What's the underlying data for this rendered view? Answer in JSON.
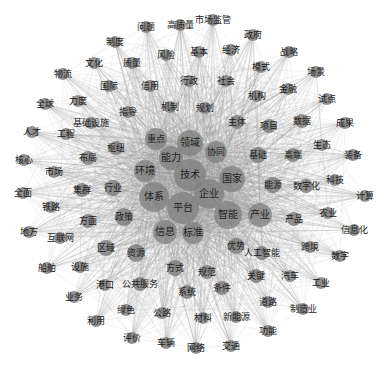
{
  "figure": {
    "type": "co-occurrence network",
    "width": 387,
    "height": 369,
    "colors": {
      "background": "#ffffff",
      "edge": "#9a9a9a",
      "node": "#7f7f7f",
      "label": "#222222"
    }
  },
  "nodes": [
    {
      "id": "问题",
      "x": 146,
      "y": 27,
      "r": 6,
      "fs": 9
    },
    {
      "id": "高质量",
      "x": 180,
      "y": 25,
      "r": 6,
      "fs": 9
    },
    {
      "id": "市场监管",
      "x": 213,
      "y": 20,
      "r": 6,
      "fs": 9
    },
    {
      "id": "政府",
      "x": 253,
      "y": 35,
      "r": 6,
      "fs": 9
    },
    {
      "id": "制度",
      "x": 115,
      "y": 42,
      "r": 6,
      "fs": 9
    },
    {
      "id": "风险",
      "x": 166,
      "y": 55,
      "r": 6,
      "fs": 9
    },
    {
      "id": "基本",
      "x": 199,
      "y": 52,
      "r": 6,
      "fs": 9
    },
    {
      "id": "经济",
      "x": 231,
      "y": 50,
      "r": 6,
      "fs": 9
    },
    {
      "id": "战略",
      "x": 289,
      "y": 52,
      "r": 6,
      "fs": 9
    },
    {
      "id": "文化",
      "x": 94,
      "y": 63,
      "r": 6,
      "fs": 9
    },
    {
      "id": "质量",
      "x": 132,
      "y": 63,
      "r": 6,
      "fs": 9
    },
    {
      "id": "模式",
      "x": 261,
      "y": 67,
      "r": 6,
      "fs": 9
    },
    {
      "id": "场景",
      "x": 316,
      "y": 72,
      "r": 6,
      "fs": 9
    },
    {
      "id": "物流",
      "x": 63,
      "y": 74,
      "r": 6,
      "fs": 9
    },
    {
      "id": "国际",
      "x": 109,
      "y": 86,
      "r": 6,
      "fs": 9
    },
    {
      "id": "信用",
      "x": 150,
      "y": 86,
      "r": 6,
      "fs": 9
    },
    {
      "id": "行政",
      "x": 189,
      "y": 81,
      "r": 6,
      "fs": 9
    },
    {
      "id": "社会",
      "x": 226,
      "y": 81,
      "r": 6,
      "fs": 9
    },
    {
      "id": "金融",
      "x": 288,
      "y": 89,
      "r": 6,
      "fs": 9
    },
    {
      "id": "全球",
      "x": 45,
      "y": 104,
      "r": 6,
      "fs": 9
    },
    {
      "id": "力度",
      "x": 78,
      "y": 101,
      "r": 6,
      "fs": 9
    },
    {
      "id": "机构",
      "x": 257,
      "y": 96,
      "r": 6,
      "fs": 9
    },
    {
      "id": "试点",
      "x": 327,
      "y": 99,
      "r": 6,
      "fs": 9
    },
    {
      "id": "指导",
      "x": 128,
      "y": 112,
      "r": 6,
      "fs": 9
    },
    {
      "id": "机制",
      "x": 170,
      "y": 107,
      "r": 6,
      "fs": 9
    },
    {
      "id": "规划",
      "x": 205,
      "y": 108,
      "r": 6,
      "fs": 9
    },
    {
      "id": "基础设施",
      "x": 91,
      "y": 123,
      "r": 6,
      "fs": 9
    },
    {
      "id": "主体",
      "x": 237,
      "y": 122,
      "r": 7,
      "fs": 9
    },
    {
      "id": "项目",
      "x": 269,
      "y": 126,
      "r": 7,
      "fs": 9
    },
    {
      "id": "数据",
      "x": 302,
      "y": 121,
      "r": 7,
      "fs": 9
    },
    {
      "id": "成果",
      "x": 345,
      "y": 123,
      "r": 6,
      "fs": 9
    },
    {
      "id": "人才",
      "x": 32,
      "y": 132,
      "r": 6,
      "fs": 9
    },
    {
      "id": "工程",
      "x": 66,
      "y": 134,
      "r": 6,
      "fs": 9
    },
    {
      "id": "重点",
      "x": 156,
      "y": 139,
      "r": 11,
      "fs": 9
    },
    {
      "id": "领域",
      "x": 190,
      "y": 143,
      "r": 13,
      "fs": 10
    },
    {
      "id": "枢纽",
      "x": 116,
      "y": 148,
      "r": 7,
      "fs": 9
    },
    {
      "id": "生态",
      "x": 322,
      "y": 145,
      "r": 6,
      "fs": 9
    },
    {
      "id": "核心",
      "x": 24,
      "y": 160,
      "r": 6,
      "fs": 9
    },
    {
      "id": "布局",
      "x": 88,
      "y": 158,
      "r": 7,
      "fs": 9
    },
    {
      "id": "能力",
      "x": 171,
      "y": 158,
      "r": 12,
      "fs": 10
    },
    {
      "id": "协同",
      "x": 216,
      "y": 152,
      "r": 11,
      "fs": 9
    },
    {
      "id": "基础",
      "x": 258,
      "y": 155,
      "r": 8,
      "fs": 9
    },
    {
      "id": "高端",
      "x": 293,
      "y": 155,
      "r": 7,
      "fs": 9
    },
    {
      "id": "装备",
      "x": 353,
      "y": 155,
      "r": 6,
      "fs": 9
    },
    {
      "id": "市场",
      "x": 54,
      "y": 172,
      "r": 6,
      "fs": 9
    },
    {
      "id": "环境",
      "x": 145,
      "y": 171,
      "r": 11,
      "fs": 10
    },
    {
      "id": "技术",
      "x": 190,
      "y": 175,
      "r": 16,
      "fs": 10
    },
    {
      "id": "国家",
      "x": 232,
      "y": 179,
      "r": 13,
      "fs": 10
    },
    {
      "id": "能源",
      "x": 273,
      "y": 185,
      "r": 8,
      "fs": 9
    },
    {
      "id": "数字化",
      "x": 306,
      "y": 186,
      "r": 7,
      "fs": 9
    },
    {
      "id": "科技",
      "x": 335,
      "y": 180,
      "r": 6,
      "fs": 9
    },
    {
      "id": "全面",
      "x": 23,
      "y": 193,
      "r": 6,
      "fs": 9
    },
    {
      "id": "集群",
      "x": 82,
      "y": 190,
      "r": 7,
      "fs": 9
    },
    {
      "id": "行业",
      "x": 113,
      "y": 188,
      "r": 8,
      "fs": 9
    },
    {
      "id": "体系",
      "x": 154,
      "y": 197,
      "r": 15,
      "fs": 10
    },
    {
      "id": "企业",
      "x": 209,
      "y": 194,
      "r": 15,
      "fs": 10
    },
    {
      "id": "计算",
      "x": 365,
      "y": 196,
      "r": 6,
      "fs": 9
    },
    {
      "id": "铁路",
      "x": 51,
      "y": 207,
      "r": 6,
      "fs": 9
    },
    {
      "id": "平台",
      "x": 183,
      "y": 208,
      "r": 16,
      "fs": 10
    },
    {
      "id": "智能",
      "x": 228,
      "y": 215,
      "r": 14,
      "fs": 10
    },
    {
      "id": "产业",
      "x": 260,
      "y": 215,
      "r": 12,
      "fs": 10
    },
    {
      "id": "产品",
      "x": 294,
      "y": 219,
      "r": 7,
      "fs": 9
    },
    {
      "id": "农业",
      "x": 328,
      "y": 213,
      "r": 6,
      "fs": 9
    },
    {
      "id": "方面",
      "x": 88,
      "y": 221,
      "r": 7,
      "fs": 9
    },
    {
      "id": "政策",
      "x": 124,
      "y": 217,
      "r": 9,
      "fs": 9
    },
    {
      "id": "信息化",
      "x": 354,
      "y": 230,
      "r": 6,
      "fs": 9
    },
    {
      "id": "地方",
      "x": 29,
      "y": 232,
      "r": 6,
      "fs": 9
    },
    {
      "id": "信息",
      "x": 165,
      "y": 232,
      "r": 12,
      "fs": 10
    },
    {
      "id": "标准",
      "x": 193,
      "y": 233,
      "r": 11,
      "fs": 10
    },
    {
      "id": "互联网",
      "x": 60,
      "y": 238,
      "r": 6,
      "fs": 9
    },
    {
      "id": "区域",
      "x": 106,
      "y": 248,
      "r": 8,
      "fs": 9
    },
    {
      "id": "资源",
      "x": 136,
      "y": 253,
      "r": 9,
      "fs": 9
    },
    {
      "id": "优势",
      "x": 236,
      "y": 246,
      "r": 8,
      "fs": 9
    },
    {
      "id": "人工智能",
      "x": 262,
      "y": 253,
      "r": 7,
      "fs": 9
    },
    {
      "id": "跨境",
      "x": 310,
      "y": 247,
      "r": 6,
      "fs": 9
    },
    {
      "id": "数字",
      "x": 340,
      "y": 256,
      "r": 6,
      "fs": 9
    },
    {
      "id": "船舶",
      "x": 47,
      "y": 268,
      "r": 6,
      "fs": 9
    },
    {
      "id": "设施",
      "x": 80,
      "y": 267,
      "r": 6,
      "fs": 9
    },
    {
      "id": "方式",
      "x": 175,
      "y": 268,
      "r": 8,
      "fs": 9
    },
    {
      "id": "规范",
      "x": 207,
      "y": 272,
      "r": 7,
      "fs": 9
    },
    {
      "id": "关键",
      "x": 256,
      "y": 276,
      "r": 7,
      "fs": 9
    },
    {
      "id": "汽车",
      "x": 290,
      "y": 276,
      "r": 6,
      "fs": 9
    },
    {
      "id": "港口",
      "x": 105,
      "y": 285,
      "r": 6,
      "fs": 9
    },
    {
      "id": "公共服务",
      "x": 140,
      "y": 284,
      "r": 7,
      "fs": 9
    },
    {
      "id": "工业",
      "x": 321,
      "y": 283,
      "r": 6,
      "fs": 9
    },
    {
      "id": "系统",
      "x": 187,
      "y": 292,
      "r": 7,
      "fs": 9
    },
    {
      "id": "条件",
      "x": 222,
      "y": 288,
      "r": 7,
      "fs": 9
    },
    {
      "id": "业务",
      "x": 74,
      "y": 297,
      "r": 6,
      "fs": 9
    },
    {
      "id": "道路",
      "x": 268,
      "y": 302,
      "r": 6,
      "fs": 9
    },
    {
      "id": "绿色",
      "x": 126,
      "y": 310,
      "r": 6,
      "fs": 9
    },
    {
      "id": "公路",
      "x": 162,
      "y": 313,
      "r": 6,
      "fs": 9
    },
    {
      "id": "制造业",
      "x": 303,
      "y": 309,
      "r": 6,
      "fs": 9
    },
    {
      "id": "材料",
      "x": 203,
      "y": 318,
      "r": 6,
      "fs": 9
    },
    {
      "id": "新能源",
      "x": 236,
      "y": 317,
      "r": 6,
      "fs": 9
    },
    {
      "id": "利用",
      "x": 96,
      "y": 321,
      "r": 6,
      "fs": 9
    },
    {
      "id": "功能",
      "x": 268,
      "y": 331,
      "r": 6,
      "fs": 9
    },
    {
      "id": "评价",
      "x": 132,
      "y": 338,
      "r": 6,
      "fs": 9
    },
    {
      "id": "车辆",
      "x": 166,
      "y": 343,
      "r": 6,
      "fs": 9
    },
    {
      "id": "网络",
      "x": 196,
      "y": 348,
      "r": 6,
      "fs": 9
    },
    {
      "id": "交通",
      "x": 231,
      "y": 346,
      "r": 6,
      "fs": 9
    }
  ],
  "hubs": [
    "技术",
    "平台",
    "企业",
    "体系",
    "国家",
    "智能",
    "领域",
    "能力",
    "信息",
    "标准",
    "产业",
    "重点",
    "环境",
    "协同"
  ]
}
